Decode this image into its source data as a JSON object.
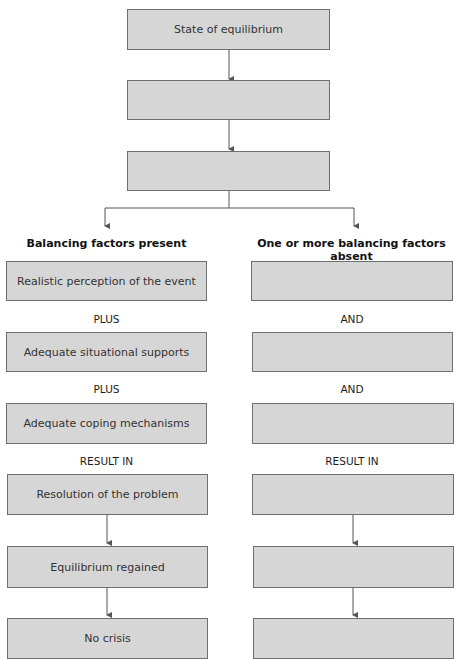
{
  "diagram": {
    "top_boxes": [
      {
        "text": "State of equilibrium"
      },
      {
        "text": ""
      },
      {
        "text": ""
      }
    ],
    "left_branch": {
      "heading": "Balancing factors present",
      "boxes": [
        {
          "text": "Realistic perception of the event"
        },
        {
          "text": "Adequate situational supports"
        },
        {
          "text": "Adequate coping mechanisms"
        },
        {
          "text": "Resolution of the problem"
        },
        {
          "text": "Equilibrium regained"
        },
        {
          "text": "No crisis"
        }
      ],
      "connectors": [
        "PLUS",
        "PLUS",
        "RESULT IN"
      ]
    },
    "right_branch": {
      "heading": "One or more balancing factors absent",
      "boxes": [
        {
          "text": ""
        },
        {
          "text": ""
        },
        {
          "text": ""
        },
        {
          "text": ""
        },
        {
          "text": ""
        },
        {
          "text": ""
        }
      ],
      "connectors": [
        "AND",
        "AND",
        "RESULT IN"
      ]
    },
    "colors": {
      "box_fill": "#d6d6d6",
      "box_border": "#6f6f6f",
      "line": "#555555"
    }
  }
}
